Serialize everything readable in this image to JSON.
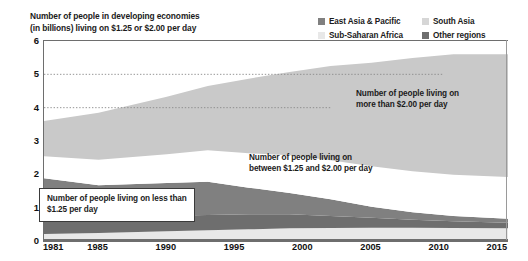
{
  "title": {
    "line1": "Number of people in developing economies",
    "line2": "(in billions) living on $1.25 or $2.00 per day"
  },
  "legend": {
    "items": [
      {
        "label": "East Asia & Pacific",
        "color": "#808080"
      },
      {
        "label": "South Asia",
        "color": "#d6d6d6"
      },
      {
        "label": "Sub-Saharan Africa",
        "color": "#e8e8e8"
      },
      {
        "label": "Other regions",
        "color": "#6e6e6e"
      }
    ]
  },
  "annotations": {
    "above2": {
      "line1": "Number of people living on",
      "line2": "more than $2.00 per day"
    },
    "between": {
      "line1": "Number of people living on",
      "line2": "between $1.25 and $2.00 per day"
    },
    "below125": {
      "line1": "Number of people living on less than",
      "line2": "$1.25 per day"
    }
  },
  "chart_data": {
    "type": "area",
    "stacked": true,
    "title": "Number of people in developing economies (in billions) living on $1.25 or $2.00 per day",
    "xlabel": "",
    "ylabel": "",
    "ylim": [
      0,
      6
    ],
    "xlim": [
      1981,
      2015
    ],
    "yticks": [
      0,
      1,
      2,
      3,
      4,
      5,
      6
    ],
    "xticks": [
      1981,
      1985,
      1990,
      1995,
      2000,
      2005,
      2010,
      2015
    ],
    "grid": "dotted horizontal gridlines at y=4 and y=5, partial width",
    "legend_position": "top-right",
    "x": [
      1981,
      1985,
      1990,
      1993,
      1996,
      1999,
      2002,
      2005,
      2008,
      2011,
      2015
    ],
    "series": [
      {
        "name": "Sub-Saharan Africa",
        "color": "#e8e8e8",
        "description": "living on less than $1.25 per day",
        "values": [
          0.21,
          0.24,
          0.29,
          0.32,
          0.35,
          0.38,
          0.39,
          0.4,
          0.4,
          0.39,
          0.38
        ]
      },
      {
        "name": "Other regions",
        "color": "#6e6e6e",
        "description": "living on less than $1.25 per day",
        "values": [
          0.55,
          0.5,
          0.47,
          0.46,
          0.45,
          0.42,
          0.36,
          0.3,
          0.24,
          0.2,
          0.17
        ]
      },
      {
        "name": "East Asia & Pacific",
        "color": "#808080",
        "description": "living on less than $1.25 per day",
        "values": [
          1.12,
          0.93,
          0.98,
          1.0,
          0.8,
          0.64,
          0.5,
          0.33,
          0.22,
          0.16,
          0.12
        ]
      },
      {
        "name": "Between $1.25 and $2.00 per day",
        "color": "#ffffff",
        "description": "white band",
        "values": [
          0.66,
          0.77,
          0.86,
          0.94,
          1.03,
          1.13,
          1.17,
          1.21,
          1.23,
          1.24,
          1.25
        ]
      },
      {
        "name": "More than $2.00 per day",
        "color": "#c9c9c9",
        "description": "South Asia shade, top band",
        "values": [
          1.06,
          1.41,
          1.73,
          1.93,
          2.24,
          2.5,
          2.83,
          3.11,
          3.4,
          3.61,
          3.68
        ]
      }
    ],
    "totals": [
      3.6,
      3.85,
      4.33,
      4.65,
      4.87,
      5.07,
      5.25,
      5.35,
      5.49,
      5.6,
      5.6
    ]
  }
}
